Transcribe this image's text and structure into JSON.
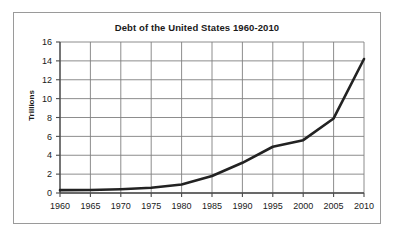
{
  "figure": {
    "title": "Debt of the United States 1960-2010",
    "y_axis_title": "Trillions",
    "border_color": "#9a9a9a",
    "background": "#ffffff"
  },
  "chart_data": {
    "type": "line",
    "title": "Debt of the United States 1960-2010",
    "xlabel": "",
    "ylabel": "Trillions",
    "x": [
      1960,
      1965,
      1970,
      1975,
      1980,
      1985,
      1990,
      1995,
      2000,
      2005,
      2010
    ],
    "values": [
      0.3,
      0.32,
      0.4,
      0.55,
      0.9,
      1.8,
      3.2,
      4.9,
      5.6,
      7.9,
      14.2
    ],
    "categories": [
      "1960",
      "1965",
      "1970",
      "1975",
      "1980",
      "1985",
      "1990",
      "1995",
      "2000",
      "2005",
      "2010"
    ],
    "xlim": [
      1960,
      2010
    ],
    "ylim": [
      0,
      16
    ],
    "xticks": [
      1960,
      1965,
      1970,
      1975,
      1980,
      1985,
      1990,
      1995,
      2000,
      2005,
      2010
    ],
    "yticks": [
      0,
      2,
      4,
      6,
      8,
      10,
      12,
      14,
      16
    ],
    "xtick_labels": [
      "1960",
      "1965",
      "1970",
      "1975",
      "1980",
      "1985",
      "1990",
      "1995",
      "2000",
      "2005",
      "2010"
    ],
    "ytick_labels": [
      "0",
      "2",
      "4",
      "6",
      "8",
      "10",
      "12",
      "14",
      "16"
    ],
    "grid": true,
    "grid_color": "#808080",
    "line_color": "#222222",
    "line_width": 2.6,
    "legend": null,
    "legend_position": "none",
    "series": [
      {
        "name": "Debt",
        "values": [
          0.3,
          0.32,
          0.4,
          0.55,
          0.9,
          1.8,
          3.2,
          4.9,
          5.6,
          7.9,
          14.2
        ]
      }
    ]
  }
}
